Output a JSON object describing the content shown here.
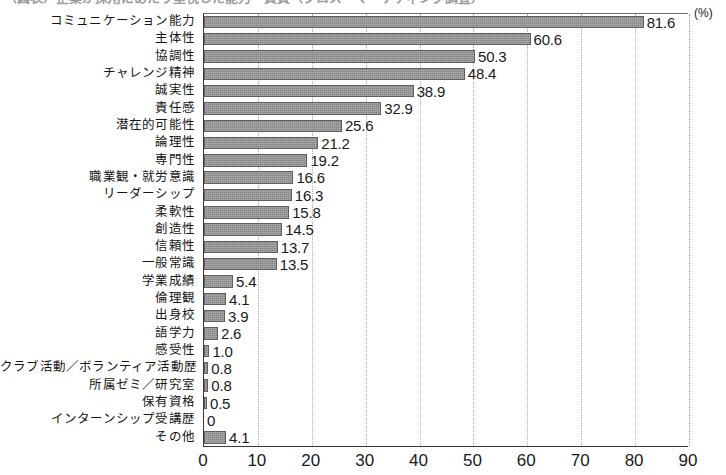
{
  "caption": {
    "text": "（図表）企業が採用にあたり重視した能力・資質（クロス・マーケティング調査）"
  },
  "chart_data": {
    "type": "bar",
    "orientation": "horizontal",
    "title": "",
    "xlabel": "(%)",
    "ylabel": "",
    "xlim": [
      0,
      90
    ],
    "xticks": [
      0,
      10,
      20,
      30,
      40,
      50,
      60,
      70,
      80,
      90
    ],
    "xtick_labels": [
      "0",
      "10",
      "20",
      "30",
      "40",
      "50",
      "60",
      "70",
      "80",
      "90"
    ],
    "unit_label": "(%)",
    "grid": "vertical-dotted",
    "legend": "none",
    "bar_color": "#868686",
    "categories": [
      "コミュニケーション能力",
      "主体性",
      "協調性",
      "チャレンジ精神",
      "誠実性",
      "責任感",
      "潜在的可能性",
      "論理性",
      "専門性",
      "職業観・就労意識",
      "リーダーシップ",
      "柔軟性",
      "創造性",
      "信頼性",
      "一般常識",
      "学業成績",
      "倫理観",
      "出身校",
      "語学力",
      "感受性",
      "クラブ活動／ボランティア活動歴",
      "所属ゼミ／研究室",
      "保有資格",
      "インターンシップ受講歴",
      "その他"
    ],
    "values": [
      81.6,
      60.6,
      50.3,
      48.4,
      38.9,
      32.9,
      25.6,
      21.2,
      19.2,
      16.6,
      16.3,
      15.8,
      14.5,
      13.7,
      13.5,
      5.4,
      4.1,
      3.9,
      2.6,
      1.0,
      0.8,
      0.8,
      0.5,
      0,
      4.1
    ],
    "value_labels": [
      "81.6",
      "60.6",
      "50.3",
      "48.4",
      "38.9",
      "32.9",
      "25.6",
      "21.2",
      "19.2",
      "16.6",
      "16.3",
      "15.8",
      "14.5",
      "13.7",
      "13.5",
      "5.4",
      "4.1",
      "3.9",
      "2.6",
      "1.0",
      "0.8",
      "0.8",
      "0.5",
      "0",
      "4.1"
    ]
  }
}
